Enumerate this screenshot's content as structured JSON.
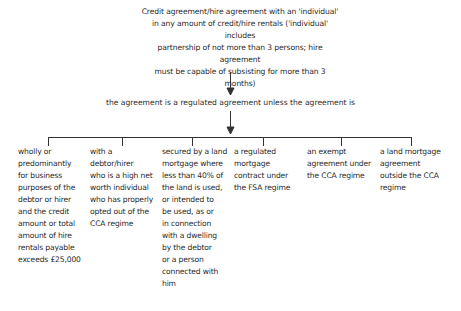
{
  "diagram": {
    "root": "Credit agreement/hire agreement with an 'individual' in any amount of credit/hire rentals ('individual' includes partnership of not more than 3 persons; hire agreement must be capable of subsisting for more than 3 months)",
    "root_lines": [
      "Credit agreement/hire agreement with an 'individual'",
      "in any amount of credit/hire rentals ('individual' includes",
      "partnership of not more than 3 persons; hire agreement",
      "must be capable of subsisting for more than 3 months)"
    ],
    "middle": "the agreement is a regulated agreement unless the agreement is",
    "branches": [
      {
        "lines": [
          "wholly or",
          "predominantly",
          "for business",
          "purposes of the",
          "debtor or hirer",
          "and the credit",
          "amount or total",
          "amount of hire",
          "rentals payable",
          "exceeds £25,000"
        ]
      },
      {
        "lines": [
          "with a",
          "debtor/hirer",
          "who is a high net",
          "worth individual",
          "who has properly",
          "opted out of the",
          "CCA regime"
        ]
      },
      {
        "lines": [
          "secured by a land",
          "mortgage where",
          "less than 40% of",
          "the land is used,",
          "or intended to",
          "be used, as or",
          "in connection",
          "with a dwelling",
          "by the debtor",
          "or a person",
          "connected with",
          "him"
        ]
      },
      {
        "lines": [
          "a regulated",
          "mortgage",
          "contract under",
          "the FSA regime"
        ]
      },
      {
        "lines": [
          "an exempt",
          "agreement under",
          "the CCA regime"
        ]
      },
      {
        "lines": [
          "a land mortgage",
          "agreement",
          "outside the CCA",
          "regime"
        ]
      }
    ]
  }
}
